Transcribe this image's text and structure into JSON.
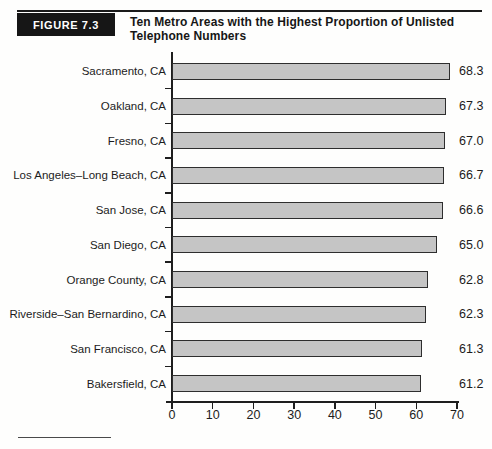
{
  "figure": {
    "label": "FIGURE 7.3",
    "title_line1": "Ten Metro Areas with the Highest Proportion of Unlisted",
    "title_line2": "Telephone Numbers"
  },
  "chart_data": {
    "type": "bar",
    "orientation": "horizontal",
    "title": "Ten Metro Areas with the Highest Proportion of Unlisted Telephone Numbers",
    "categories": [
      "Sacramento, CA",
      "Oakland, CA",
      "Fresno, CA",
      "Los Angeles–Long Beach, CA",
      "San Jose, CA",
      "San Diego, CA",
      "Orange County, CA",
      "Riverside–San Bernardino, CA",
      "San Francisco, CA",
      "Bakersfield, CA"
    ],
    "values": [
      68.3,
      67.3,
      67.0,
      66.7,
      66.6,
      65.0,
      62.8,
      62.3,
      61.3,
      61.2
    ],
    "value_labels": [
      "68.3",
      "67.3",
      "67.0",
      "66.7",
      "66.6",
      "65.0",
      "62.8",
      "62.3",
      "61.3",
      "61.2"
    ],
    "x_ticks": [
      "0",
      "10",
      "20",
      "30",
      "40",
      "50",
      "60",
      "70"
    ],
    "xlim": [
      0,
      70
    ],
    "xlabel": "",
    "ylabel": "",
    "grid": false,
    "legend": "none",
    "value_labels_position": "right",
    "bar_color": "#c5c5c5",
    "bar_border_color": "#2e2e2e"
  },
  "colors": {
    "header_box": "#161616",
    "header_text": "#ffffff",
    "text": "#1c1c1c",
    "axis": "#1e1e1e"
  }
}
